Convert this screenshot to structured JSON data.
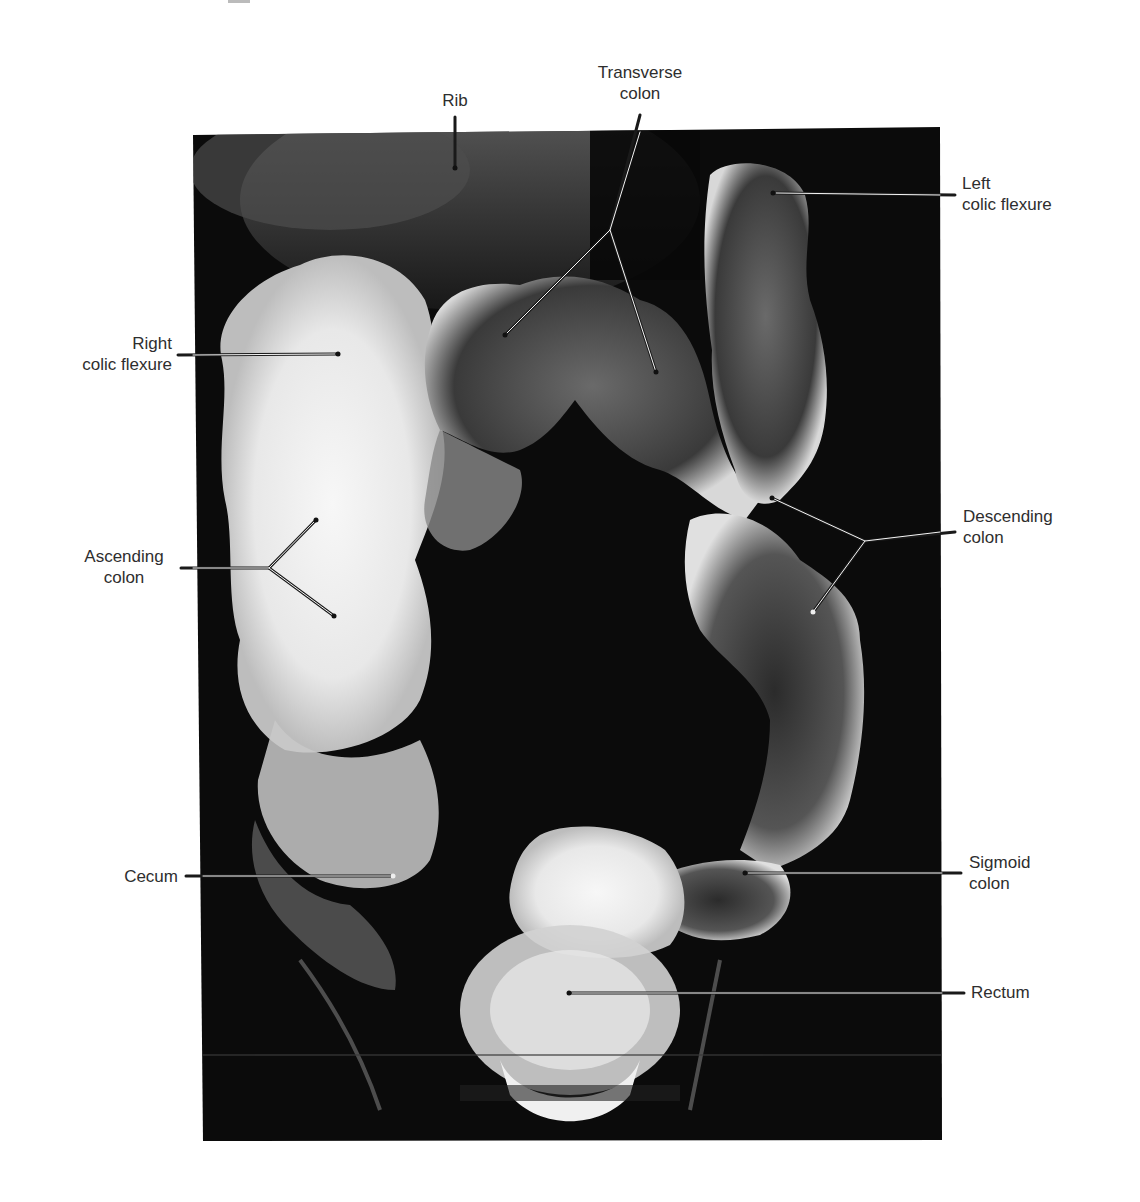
{
  "figure": {
    "type": "barium enema radiograph (anteroposterior view of large intestine)",
    "colors": {
      "background": "#ffffff",
      "radiograph_bg": "#0b0b0b",
      "contrast_bright": "#f2f2f2",
      "label_text": "#2e2e2e",
      "leader_line": "#1a1a1a"
    }
  },
  "labels": {
    "rib": {
      "line1": "Rib"
    },
    "transverse_colon": {
      "line1": "Transverse",
      "line2": "colon"
    },
    "left_colic_flexure": {
      "line1": "Left",
      "line2": "colic flexure"
    },
    "right_colic_flexure": {
      "line1": "Right",
      "line2": "colic flexure"
    },
    "ascending_colon": {
      "line1": "Ascending",
      "line2": "colon"
    },
    "descending_colon": {
      "line1": "Descending",
      "line2": "colon"
    },
    "cecum": {
      "line1": "Cecum"
    },
    "sigmoid_colon": {
      "line1": "Sigmoid",
      "line2": "colon"
    },
    "rectum": {
      "line1": "Rectum"
    }
  }
}
